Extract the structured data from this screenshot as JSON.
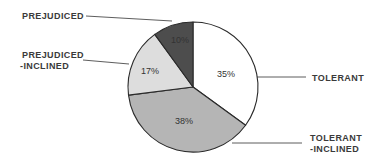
{
  "chart_data": {
    "type": "pie",
    "title": "",
    "start_angle_deg": 0,
    "direction": "clockwise",
    "categories": [
      "Tolerant",
      "Tolerant-Inclined",
      "Prejudiced-Inclined",
      "Prejudiced"
    ],
    "values": [
      35,
      38,
      17,
      10
    ],
    "slices": [
      {
        "key": "tolerant",
        "label_lines": [
          "TOLERANT"
        ],
        "value": 35,
        "pct_label": "35%",
        "color": "#ffffff"
      },
      {
        "key": "tolerant_inclined",
        "label_lines": [
          "TOLERANT",
          "-INCLINED"
        ],
        "value": 38,
        "pct_label": "38%",
        "color": "#b5b5b5"
      },
      {
        "key": "prejudiced_inclined",
        "label_lines": [
          "PREJUDICED",
          "-INCLINED"
        ],
        "value": 17,
        "pct_label": "17%",
        "color": "#dddddd"
      },
      {
        "key": "prejudiced",
        "label_lines": [
          "PREJUDICED"
        ],
        "value": 10,
        "pct_label": "10%",
        "color": "#4d4d4d"
      }
    ],
    "legend": "callout labels with leader lines"
  },
  "labels": {
    "tolerant": "TOLERANT",
    "tolerant_inclined_1": "TOLERANT",
    "tolerant_inclined_2": "-INCLINED",
    "prejudiced_inclined_1": "PREJUDICED",
    "prejudiced_inclined_2": "-INCLINED",
    "prejudiced": "PREJUDICED"
  },
  "pcts": {
    "tolerant": "35%",
    "tolerant_inclined": "38%",
    "prejudiced_inclined": "17%",
    "prejudiced": "10%"
  }
}
